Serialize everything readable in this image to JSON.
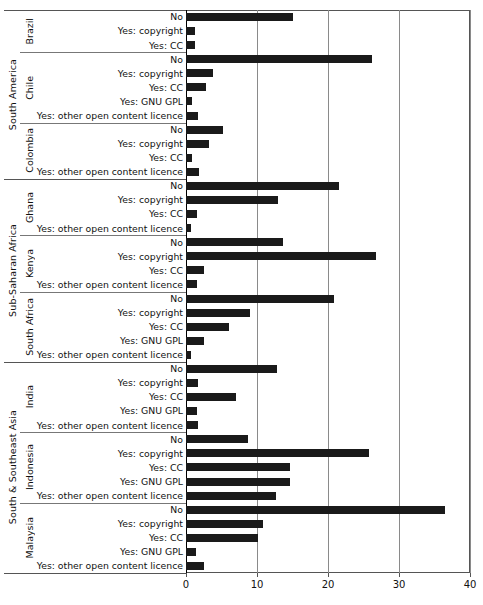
{
  "chart_data": {
    "type": "bar",
    "orientation": "horizontal",
    "title": "",
    "xlabel": "",
    "ylabel": "",
    "xlim": [
      0,
      40
    ],
    "xticks": [
      0,
      10,
      20,
      30,
      40
    ],
    "xtick_labels": [
      "0",
      "10",
      "20",
      "30",
      "40"
    ],
    "grid": true,
    "legend": "none",
    "bar_color": "#1a1a1a",
    "categories": [
      "No",
      "Yes: copyright",
      "Yes: CC",
      "Yes: GNU GPL",
      "Yes: other open content licence"
    ],
    "regions": [
      {
        "name": "South America",
        "countries": [
          {
            "name": "Brazil",
            "rows": [
              {
                "label": "No",
                "value": 15.0
              },
              {
                "label": "Yes: copyright",
                "value": 1.3
              },
              {
                "label": "Yes: CC",
                "value": 1.3
              }
            ]
          },
          {
            "name": "Chile",
            "rows": [
              {
                "label": "No",
                "value": 26.2
              },
              {
                "label": "Yes: copyright",
                "value": 3.8
              },
              {
                "label": "Yes: CC",
                "value": 2.8
              },
              {
                "label": "Yes: GNU GPL",
                "value": 0.8
              },
              {
                "label": "Yes: other open content licence",
                "value": 1.7
              }
            ]
          },
          {
            "name": "Colombia",
            "rows": [
              {
                "label": "No",
                "value": 5.2
              },
              {
                "label": "Yes: copyright",
                "value": 3.3
              },
              {
                "label": "Yes: CC",
                "value": 0.8
              },
              {
                "label": "Yes: other open content licence",
                "value": 1.9
              }
            ]
          }
        ]
      },
      {
        "name": "Sub-Saharan Africa",
        "countries": [
          {
            "name": "Ghana",
            "rows": [
              {
                "label": "No",
                "value": 21.6
              },
              {
                "label": "Yes: copyright",
                "value": 12.9
              },
              {
                "label": "Yes: CC",
                "value": 1.6
              },
              {
                "label": "Yes: other open content licence",
                "value": 0.7
              }
            ]
          },
          {
            "name": "Kenya",
            "rows": [
              {
                "label": "No",
                "value": 13.7
              },
              {
                "label": "Yes: copyright",
                "value": 26.8
              },
              {
                "label": "Yes: CC",
                "value": 2.6
              },
              {
                "label": "Yes: other open content licence",
                "value": 1.5
              }
            ]
          },
          {
            "name": "South Africa",
            "rows": [
              {
                "label": "No",
                "value": 20.8
              },
              {
                "label": "Yes: copyright",
                "value": 9.0
              },
              {
                "label": "Yes: CC",
                "value": 6.0
              },
              {
                "label": "Yes: GNU GPL",
                "value": 2.6
              },
              {
                "label": "Yes: other open content licence",
                "value": 0.7
              }
            ]
          }
        ]
      },
      {
        "name": "South & Southeast Asia",
        "countries": [
          {
            "name": "India",
            "rows": [
              {
                "label": "No",
                "value": 12.8
              },
              {
                "label": "Yes: copyright",
                "value": 1.7
              },
              {
                "label": "Yes: CC",
                "value": 7.0
              },
              {
                "label": "Yes: GNU GPL",
                "value": 1.5
              },
              {
                "label": "Yes: other open content licence",
                "value": 1.7
              }
            ]
          },
          {
            "name": "Indonesia",
            "rows": [
              {
                "label": "No",
                "value": 8.8
              },
              {
                "label": "Yes: copyright",
                "value": 25.8
              },
              {
                "label": "Yes: CC",
                "value": 14.7
              },
              {
                "label": "Yes: GNU GPL",
                "value": 14.7
              },
              {
                "label": "Yes: other open content licence",
                "value": 12.7
              }
            ]
          },
          {
            "name": "Malaysia",
            "rows": [
              {
                "label": "No",
                "value": 36.5
              },
              {
                "label": "Yes: copyright",
                "value": 10.9
              },
              {
                "label": "Yes: CC",
                "value": 10.1
              },
              {
                "label": "Yes: GNU GPL",
                "value": 1.4
              },
              {
                "label": "Yes: other open content licence",
                "value": 2.6
              }
            ]
          }
        ]
      }
    ]
  }
}
